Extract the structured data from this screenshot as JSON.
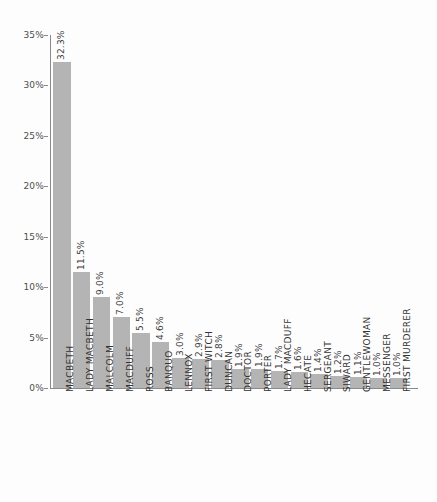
{
  "chart_data": {
    "type": "bar",
    "title": "",
    "subtitle": "",
    "xlabel": "",
    "ylabel": "",
    "ylim": [
      0,
      35
    ],
    "grid": false,
    "legend": false,
    "y_tick_labels": [
      "35%",
      "30%",
      "25%",
      "20%",
      "15%",
      "10%",
      "5%",
      "0%"
    ],
    "y_ticks": [
      35,
      30,
      25,
      20,
      15,
      10,
      5,
      0
    ],
    "value_suffix": "%",
    "categories": [
      "MACBETH",
      "LADY MACBETH",
      "MALCOLM",
      "MACDUFF",
      "ROSS",
      "BANQUO",
      "LENNOX",
      "FIRST WITCH",
      "DUNCAN",
      "DOCTOR",
      "PORTER",
      "LADY MACDUFF",
      "HECATE",
      "SERGEANT",
      "SIWARD",
      "GENTLEWOMAN",
      "MESSENGER",
      "FIRST MURDERER"
    ],
    "values": [
      32.3,
      11.5,
      9.0,
      7.0,
      5.5,
      4.6,
      3.0,
      2.9,
      2.8,
      1.9,
      1.9,
      1.7,
      1.6,
      1.4,
      1.2,
      1.1,
      1.0,
      1.0
    ],
    "value_labels": [
      "32.3%",
      "11.5%",
      "9.0%",
      "7.0%",
      "5.5%",
      "4.6%",
      "3.0%",
      "2.9%",
      "2.8%",
      "1.9%",
      "1.9%",
      "1.7%",
      "1.6%",
      "1.4%",
      "1.2%",
      "1.1%",
      "1.0%",
      "1.0%"
    ],
    "colors": {
      "bar": "#b4b4b4",
      "axis": "#8a8a8a",
      "text": "#333333",
      "background": "#fdfdfd"
    }
  }
}
